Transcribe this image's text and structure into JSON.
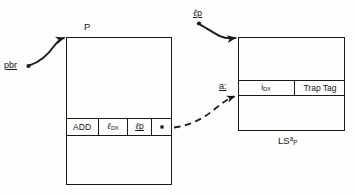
{
  "figure": {
    "ink_color": "#1a1a1a",
    "background_color": "#fdfdfc"
  },
  "process_box": {
    "title": "P",
    "instruction": {
      "cells": [
        {
          "name": "opcode",
          "text": "ADD"
        },
        {
          "name": "operand-dx",
          "text": "DX"
        },
        {
          "name": "operand-lp",
          "text": "p"
        },
        {
          "name": "pointer",
          "text": ""
        }
      ]
    }
  },
  "local_storage_box": {
    "caption_base": "LS",
    "caption_sup": "a",
    "caption_sub": "P",
    "row_address_label": "a:",
    "cells": [
      {
        "name": "item-dx",
        "base": "i",
        "sub": "DX"
      },
      {
        "name": "trap-tag",
        "text": "Trap Tag"
      }
    ]
  },
  "annotations": {
    "pbr_label": "pbr",
    "lp_label": "p"
  }
}
